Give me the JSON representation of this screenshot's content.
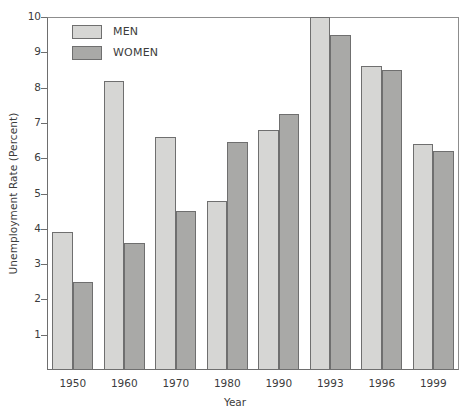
{
  "chart_data": {
    "type": "bar",
    "title": "",
    "xlabel": "Year",
    "ylabel": "Unemployment Rate (Percent)",
    "categories": [
      "1950",
      "1960",
      "1970",
      "1980",
      "1990",
      "1993",
      "1996",
      "1999"
    ],
    "series": [
      {
        "name": "MEN",
        "color": "#d6d6d4",
        "values": [
          3.9,
          8.2,
          6.6,
          4.8,
          6.8,
          10.0,
          8.6,
          6.4
        ]
      },
      {
        "name": "WOMEN",
        "color": "#a9a9a7",
        "values": [
          2.5,
          3.6,
          4.5,
          6.45,
          7.25,
          9.5,
          8.5,
          6.2
        ]
      }
    ],
    "ylim": [
      0,
      10
    ],
    "yticks": [
      "1",
      "2",
      "3",
      "4",
      "5",
      "6",
      "7",
      "8",
      "9",
      "10"
    ],
    "grid": false,
    "legend_position": "top-left"
  },
  "legend": {
    "items": [
      {
        "label": "MEN",
        "swatch": "men"
      },
      {
        "label": "WOMEN",
        "swatch": "women"
      }
    ]
  }
}
